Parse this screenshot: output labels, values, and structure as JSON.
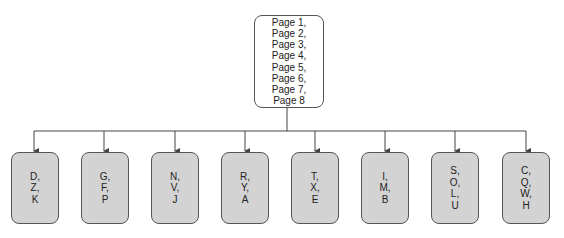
{
  "root": {
    "lines": [
      "Page 1,",
      "Page 2,",
      "Page 3,",
      "Page 4,",
      "Page 5,",
      "Page 6,",
      "Page 7,",
      "Page 8"
    ]
  },
  "children": [
    {
      "lines": [
        "D,",
        "Z,",
        "K"
      ]
    },
    {
      "lines": [
        "G,",
        "F,",
        "P"
      ]
    },
    {
      "lines": [
        "N,",
        "V,",
        "J"
      ]
    },
    {
      "lines": [
        "R,",
        "Y,",
        "A"
      ]
    },
    {
      "lines": [
        "T,",
        "X,",
        "E"
      ]
    },
    {
      "lines": [
        "I,",
        "M,",
        "B"
      ]
    },
    {
      "lines": [
        "S,",
        "O,",
        "L,",
        "U"
      ]
    },
    {
      "lines": [
        "C,",
        "Q,",
        "W,",
        "H"
      ]
    }
  ],
  "colors": {
    "line": "#444444",
    "child_fill": "#d3d3d3",
    "root_fill": "#ffffff"
  }
}
